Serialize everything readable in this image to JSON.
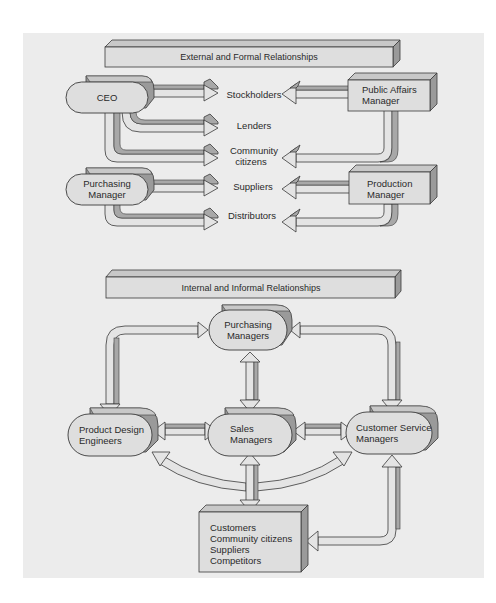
{
  "colors": {
    "panel": "#ececec",
    "face": "#dedede",
    "top": "#c8c8c8",
    "side": "#9a9a9a",
    "outline": "#3a3a3a",
    "arrow_light": "#e4e4e4",
    "arrow_dark": "#a8a8a8"
  },
  "external": {
    "title": "External and Formal Relationships",
    "nodes": {
      "ceo": "CEO",
      "purchasing_line1": "Purchasing",
      "purchasing_line2": "Manager",
      "public_affairs_line1": "Public Affairs",
      "public_affairs_line2": "Manager",
      "production_line1": "Production",
      "production_line2": "Manager"
    },
    "targets": {
      "stockholders": "Stockholders",
      "lenders": "Lenders",
      "community_line1": "Community",
      "community_line2": "citizens",
      "suppliers": "Suppliers",
      "distributors": "Distributors"
    }
  },
  "internal": {
    "title": "Internal and Informal Relationships",
    "nodes": {
      "purchasing_line1": "Purchasing",
      "purchasing_line2": "Managers",
      "product_design_line1": "Product Design",
      "product_design_line2": "Engineers",
      "sales_line1": "Sales",
      "sales_line2": "Managers",
      "customer_service_line1": "Customer Service",
      "customer_service_line2": "Managers"
    },
    "external_box": [
      "Customers",
      "Community citizens",
      "Suppliers",
      "Competitors"
    ]
  }
}
